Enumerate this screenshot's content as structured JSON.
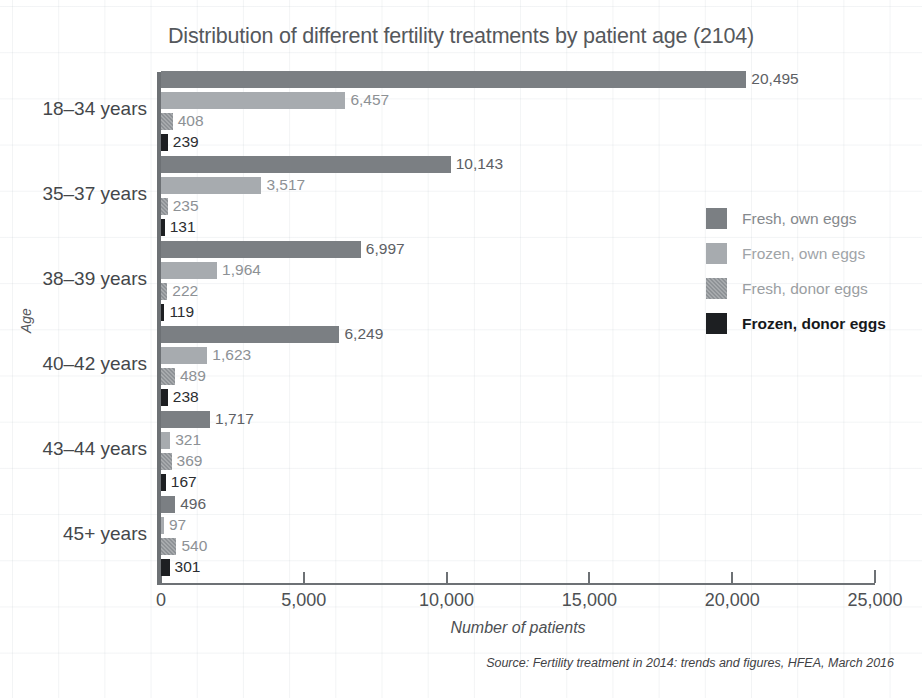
{
  "chart_data": {
    "type": "bar",
    "orientation": "horizontal",
    "title": "Distribution of different fertility treatments by patient age (2104)",
    "xlabel": "Number of patients",
    "ylabel": "Age",
    "xlim": [
      0,
      25000
    ],
    "xticks": [
      0,
      5000,
      10000,
      15000,
      20000,
      25000
    ],
    "xticklabels": [
      "0",
      "5,000",
      "10,000",
      "15,000",
      "20,000",
      "25,000"
    ],
    "grid": false,
    "legend_position": "right",
    "categories": [
      "18–34 years",
      "35–37 years",
      "38–39 years",
      "40–42 years",
      "43–44 years",
      "45+ years"
    ],
    "series": [
      {
        "name": "Fresh, own eggs",
        "color": "#7b7f83",
        "values": [
          20495,
          10143,
          6997,
          6249,
          1717,
          496
        ],
        "labels": [
          "20,495",
          "10,143",
          "6,997",
          "6,249",
          "1,717",
          "496"
        ]
      },
      {
        "name": "Frozen, own eggs",
        "color": "#a7abaf",
        "values": [
          6457,
          3517,
          1964,
          1623,
          321,
          97
        ],
        "labels": [
          "6,457",
          "3,517",
          "1,964",
          "1,623",
          "321",
          "97"
        ]
      },
      {
        "name": "Fresh, donor eggs",
        "color": "#8e9296",
        "values": [
          408,
          235,
          222,
          489,
          369,
          540
        ],
        "labels": [
          "408",
          "235",
          "222",
          "489",
          "369",
          "540"
        ]
      },
      {
        "name": "Frozen, donor eggs",
        "color": "#1d1f22",
        "values": [
          239,
          131,
          119,
          238,
          167,
          301
        ],
        "labels": [
          "239",
          "131",
          "119",
          "238",
          "167",
          "301"
        ]
      }
    ]
  },
  "source": {
    "prefix": "Source:",
    "text": "Fertility treatment in 2014: trends and figures,",
    "publisher": "HFEA, March 2016"
  }
}
